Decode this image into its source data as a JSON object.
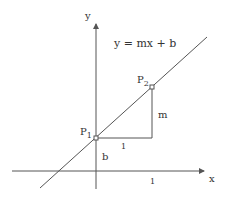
{
  "diagram": {
    "equation": "y = mx + b",
    "axes": {
      "x_label": "x",
      "y_label": "y",
      "x_tick_label": "1"
    },
    "points": [
      {
        "name": "P",
        "subscript": "1"
      },
      {
        "name": "P",
        "subscript": "2"
      }
    ],
    "labels": {
      "run": "1",
      "rise": "m",
      "intercept": "b"
    },
    "colors": {
      "stroke": "#555555",
      "text": "#333333"
    }
  }
}
